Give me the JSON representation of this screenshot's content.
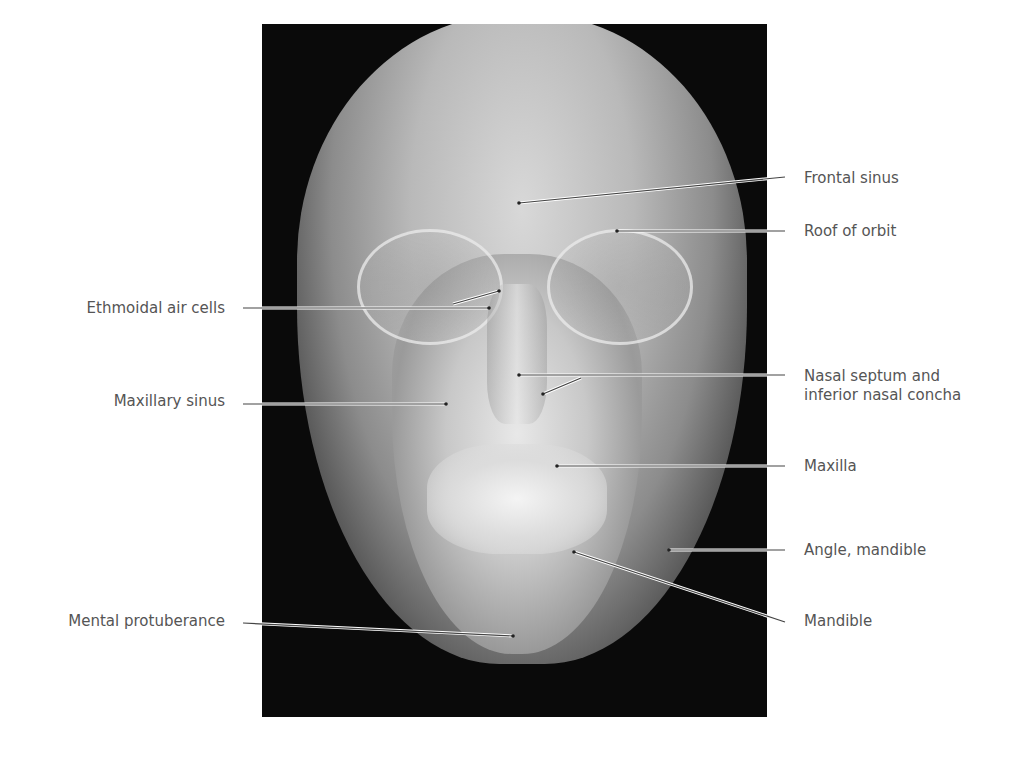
{
  "figure": {
    "labels_right": [
      {
        "id": "frontal-sinus",
        "text": "Frontal sinus",
        "y": 178
      },
      {
        "id": "roof-of-orbit",
        "text": "Roof of orbit",
        "y": 231
      },
      {
        "id": "nasal-septum",
        "text": "Nasal septum and",
        "text2": "inferior nasal concha",
        "y": 376
      },
      {
        "id": "maxilla",
        "text": "Maxilla",
        "y": 466
      },
      {
        "id": "angle-mandible",
        "text": "Angle, mandible",
        "y": 550
      },
      {
        "id": "mandible",
        "text": "Mandible",
        "y": 621
      }
    ],
    "labels_left": [
      {
        "id": "ethmoidal-air-cells",
        "text": "Ethmoidal air cells",
        "y": 308
      },
      {
        "id": "maxillary-sinus",
        "text": "Maxillary sinus",
        "y": 401
      },
      {
        "id": "mental-protuberance",
        "text": "Mental protuberance",
        "y": 621
      }
    ],
    "colors": {
      "label_text": "#555555",
      "leader_line": "#444444",
      "background": "#ffffff"
    }
  }
}
